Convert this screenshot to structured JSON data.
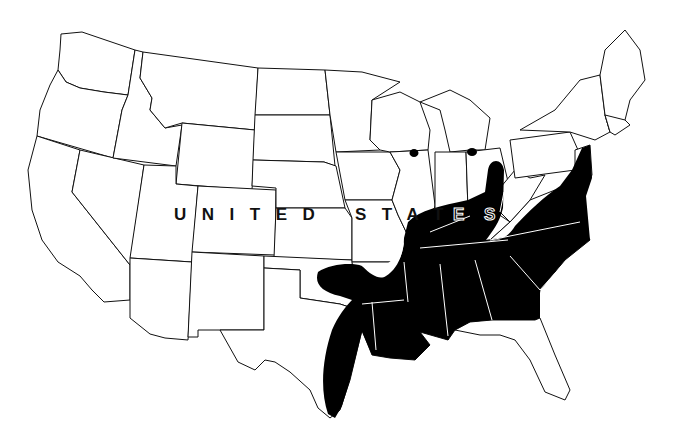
{
  "map": {
    "title": "Distribution range map",
    "country_label_part1": "UNITED",
    "country_label_part2": "STAT",
    "country_label_part3": "E",
    "country_label_part4": "S",
    "colors": {
      "background": "#ffffff",
      "state_outline": "#111111",
      "range_fill": "#000000",
      "range_borders": "#ffffff"
    },
    "range_regions": [
      "Southeastern United States (Texas coast to Virginia/New Jersey)",
      "Oklahoma lobe",
      "Ohio River valley extension",
      "Isolated occurrence: Wisconsin",
      "Isolated occurrence: Michigan"
    ]
  }
}
